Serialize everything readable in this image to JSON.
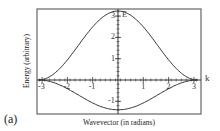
{
  "chart_data": {
    "type": "line",
    "title": "",
    "panel_label": "(a)",
    "xlabel": "Wavevector (in radians)",
    "ylabel": "Energy (arbitrary)",
    "axis_inner_labels": {
      "x": "k",
      "y": "E"
    },
    "xlim": [
      -3.14159,
      3.14159
    ],
    "ylim": [
      -1.45,
      3.3
    ],
    "x_ticks": [
      -3,
      -2,
      -1,
      1,
      2,
      3
    ],
    "y_ticks": [
      -1,
      1,
      2,
      3
    ],
    "grid": false,
    "legend": null,
    "series": [
      {
        "name": "upper band",
        "formula": "E = 1.62*(1+cos k)",
        "x": [
          -3.14,
          -2.5,
          -2,
          -1.5,
          -1,
          -0.5,
          0,
          0.5,
          1,
          1.5,
          2,
          2.5,
          3.14
        ],
        "values": [
          0.0,
          0.32,
          0.95,
          1.73,
          2.5,
          3.04,
          3.24,
          3.04,
          2.5,
          1.73,
          0.95,
          0.32,
          0.0
        ]
      },
      {
        "name": "lower band",
        "formula": "E = -0.7*(1+cos k)",
        "x": [
          -3.14,
          -2.5,
          -2,
          -1.5,
          -1,
          -0.5,
          0,
          0.5,
          1,
          1.5,
          2,
          2.5,
          3.14
        ],
        "values": [
          0.0,
          -0.14,
          -0.41,
          -0.75,
          -1.08,
          -1.31,
          -1.4,
          -1.31,
          -1.08,
          -0.75,
          -0.41,
          -0.14,
          0.0
        ]
      }
    ]
  },
  "labels": {
    "panel": "(a)",
    "xlabel": "Wavevector (in radians)",
    "ylabel": "Energy (arbitrary)",
    "k": "k",
    "E": "E"
  },
  "colors": {
    "frame": "#555555",
    "curve": "#333333",
    "axis": "#333333"
  }
}
